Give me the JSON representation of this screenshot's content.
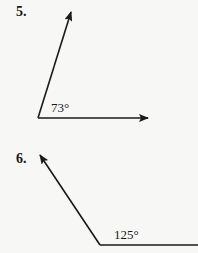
{
  "problems": [
    {
      "number": "5.",
      "angle_label": "73°",
      "angle_degrees": 73,
      "vertex": [
        38,
        118
      ],
      "ray_ends": [
        [
          148,
          118
        ],
        [
          71,
          12
        ]
      ]
    },
    {
      "number": "6.",
      "angle_label": "125°",
      "angle_degrees": 125,
      "vertex": [
        100,
        245
      ],
      "ray_ends": [
        [
          198,
          245
        ],
        [
          40,
          155
        ]
      ]
    }
  ],
  "colors": {
    "line": "#1a1a1a",
    "background": "#f7f7f5"
  }
}
